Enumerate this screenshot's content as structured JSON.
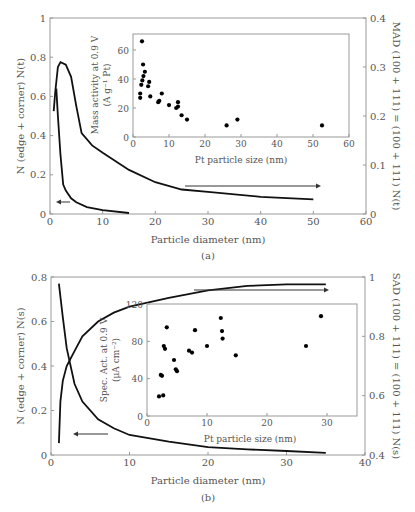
{
  "chart_data": [
    {
      "panel": "(a)",
      "type": "line",
      "xlabel": "Particle diameter (nm)",
      "ylabel_left": "N (edge + corner) N(t)",
      "ylabel_right": "MAD (100 + 111) = (100 + 111) N(t)",
      "xlim": [
        0,
        60
      ],
      "ylim_left": [
        0,
        1
      ],
      "ylim_right": [
        0,
        0.4
      ],
      "x_ticks": [
        "0",
        "10",
        "20",
        "30",
        "40",
        "50",
        "60"
      ],
      "y_left_ticks": [
        "0",
        "0.2",
        "0.4",
        "0.6",
        "0.8",
        "1"
      ],
      "y_right_ticks": [
        "0",
        "0.1",
        "0.2",
        "0.3",
        "0.4"
      ],
      "series": [
        {
          "name": "N(edge+corner) N(t)",
          "axis": "left",
          "x": [
            1.2,
            1.5,
            2,
            2.5,
            3,
            4,
            5,
            7,
            10,
            15
          ],
          "y": [
            0.64,
            0.5,
            0.3,
            0.15,
            0.12,
            0.08,
            0.06,
            0.035,
            0.02,
            0.005
          ]
        },
        {
          "name": "MAD (100+111)",
          "axis": "right",
          "x": [
            0.7,
            1,
            1.5,
            2,
            3,
            4,
            5,
            6,
            8,
            10,
            15,
            20,
            25,
            30,
            40,
            50
          ],
          "y": [
            0.21,
            0.25,
            0.3,
            0.31,
            0.305,
            0.28,
            0.22,
            0.165,
            0.14,
            0.125,
            0.09,
            0.065,
            0.05,
            0.045,
            0.035,
            0.03
          ]
        }
      ],
      "annotations": [
        {
          "type": "arrow",
          "direction": "left",
          "target": "left-axis"
        },
        {
          "type": "arrow",
          "direction": "right",
          "target": "right-axis"
        }
      ],
      "inset": {
        "type": "scatter",
        "xlabel": "Pt particle size (nm)",
        "ylabel": "Mass activity at 0.9 V (A g⁻¹ Pt)",
        "xlim": [
          0,
          60
        ],
        "ylim": [
          0,
          70
        ],
        "x_ticks": [
          "0",
          "10",
          "20",
          "30",
          "40",
          "50",
          "60"
        ],
        "y_ticks": [
          "0",
          "20",
          "40",
          "60"
        ],
        "x": [
          2.5,
          2.8,
          2,
          2.3,
          2.6,
          2.9,
          3.3,
          2,
          4.2,
          4.5,
          4.8,
          7,
          7.3,
          8,
          10,
          12,
          12.5,
          12.5,
          13.5,
          15,
          26,
          29,
          52.5
        ],
        "y": [
          66,
          50,
          30,
          36,
          39,
          42,
          45,
          27,
          35,
          38,
          28,
          24,
          25,
          30,
          22,
          20,
          24,
          21,
          15,
          12,
          8,
          12,
          8
        ]
      }
    },
    {
      "panel": "(b)",
      "type": "line",
      "xlabel": "Particle diameter (nm)",
      "ylabel_left": "N (edge + corner) N(s)",
      "ylabel_right": "SAD (100 + 111) = (100 + 111) N(s)",
      "xlim": [
        0,
        40
      ],
      "ylim_left": [
        0,
        0.8
      ],
      "ylim_right": [
        0.4,
        1
      ],
      "x_ticks": [
        "0",
        "10",
        "20",
        "30",
        "40"
      ],
      "y_left_ticks": [
        "0",
        "0.2",
        "0.4",
        "0.6",
        "0.8"
      ],
      "y_right_ticks": [
        "0.4",
        "0.6",
        "0.8",
        "1"
      ],
      "series": [
        {
          "name": "N(edge+corner) N(s)",
          "axis": "left",
          "x": [
            1,
            1.5,
            2,
            3,
            4,
            6,
            8,
            10,
            15,
            20,
            25,
            30,
            35
          ],
          "y": [
            0.77,
            0.62,
            0.48,
            0.32,
            0.24,
            0.16,
            0.12,
            0.09,
            0.06,
            0.035,
            0.025,
            0.018,
            0.01
          ]
        },
        {
          "name": "SAD (100+111)",
          "axis": "right",
          "x": [
            1,
            1.2,
            1.5,
            2,
            3,
            4,
            6,
            8,
            10,
            15,
            20,
            25,
            30,
            35
          ],
          "y": [
            0.44,
            0.58,
            0.65,
            0.7,
            0.75,
            0.8,
            0.85,
            0.88,
            0.9,
            0.93,
            0.955,
            0.97,
            0.975,
            0.975
          ]
        }
      ],
      "annotations": [
        {
          "type": "arrow",
          "direction": "left",
          "target": "left-axis"
        },
        {
          "type": "arrow",
          "direction": "right",
          "target": "right-axis"
        }
      ],
      "inset": {
        "type": "scatter",
        "xlabel": "Pt particle size (nm)",
        "ylabel": "Spec. Act. at 0.9 V (μA cm⁻²)",
        "xlim": [
          0,
          35
        ],
        "ylim": [
          0,
          120
        ],
        "x_ticks": [
          "0",
          "10",
          "20",
          "30"
        ],
        "y_ticks": [
          "0",
          "40",
          "80",
          "120"
        ],
        "x": [
          2,
          2.3,
          2.5,
          2.7,
          2.8,
          3.0,
          3.3,
          4.5,
          4.8,
          5.0,
          7,
          7.5,
          8,
          10,
          12.3,
          12.5,
          12.6,
          14.8,
          26.5,
          29
        ],
        "y": [
          21,
          44,
          43,
          22,
          75,
          72,
          95,
          60,
          50,
          48,
          70,
          68,
          92,
          75,
          105,
          91,
          83,
          65,
          75,
          107
        ]
      }
    }
  ],
  "labels": {
    "panel_a": "(a)",
    "panel_b": "(b)",
    "a_xlabel": "Particle diameter (nm)",
    "a_ylabel_left": "N (edge + corner) N(t)",
    "a_ylabel_right": "MAD (100 + 111) = (100 + 111) N(t)",
    "a_inset_xlabel": "Pt particle size (nm)",
    "a_inset_ylabel1": "Mass activity at 0.9 V",
    "a_inset_ylabel2": "(A g⁻¹ Pt)",
    "b_xlabel": "Particle diameter (nm)",
    "b_ylabel_left": "N (edge + corner) N(s)",
    "b_ylabel_right": "SAD (100 + 111) = (100 + 111) N(s)",
    "b_inset_xlabel": "Pt particle size (nm)",
    "b_inset_ylabel1": "Spec. Act. at 0.9 V",
    "b_inset_ylabel2": "(μA cm⁻²)"
  }
}
